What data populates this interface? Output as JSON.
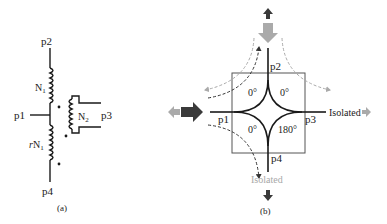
{
  "figure_a": {
    "caption": "(a)",
    "ports": {
      "p1": "p1",
      "p2": "p2",
      "p3": "p3",
      "p4": "p4"
    },
    "winding_upper": {
      "label": "N",
      "sub": "1"
    },
    "winding_lower": {
      "prefix": "r",
      "label": "N",
      "sub": "1"
    },
    "winding_secondary": {
      "label": "N",
      "sub": "2"
    }
  },
  "figure_b": {
    "caption": "(b)",
    "ports": {
      "p1": "p1",
      "p2": "p2",
      "p3": "p3",
      "p4": "p4"
    },
    "phases": {
      "top_left": "0°",
      "top_right": "0°",
      "bottom_left": "0°",
      "bottom_right": "180°"
    },
    "isolated_right": "Isolated",
    "isolated_bottom": "Isolated",
    "colors": {
      "dark_arrow": "#3a3a3a",
      "light_arrow": "#a8a8a8",
      "box": "#555555"
    }
  }
}
